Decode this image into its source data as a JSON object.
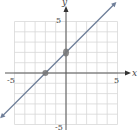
{
  "chart_data": {
    "type": "line",
    "title": "",
    "xlabel": "x",
    "ylabel": "y",
    "xlim": [
      -5,
      5
    ],
    "ylim": [
      -5,
      5
    ],
    "grid": true,
    "x_tick_labels": [
      "-5",
      "5"
    ],
    "y_tick_labels": [
      "5",
      "-5"
    ],
    "series": [
      {
        "name": "y = x + 2",
        "x": [
          -6,
          5
        ],
        "y": [
          -4,
          7
        ],
        "slope": 1,
        "intercept": 2
      }
    ],
    "points": [
      {
        "x": -2,
        "y": 0,
        "label": "x-intercept"
      },
      {
        "x": 0,
        "y": 2,
        "label": "y-intercept"
      }
    ],
    "colors": {
      "line": "#6f7f99",
      "grid": "#d8d8d8",
      "axis": "#555555",
      "point": "#777777"
    }
  },
  "labels": {
    "x_axis": "x",
    "y_axis": "y",
    "x_min": "-5",
    "x_max": "5",
    "y_max": "5",
    "y_min": "-5"
  }
}
